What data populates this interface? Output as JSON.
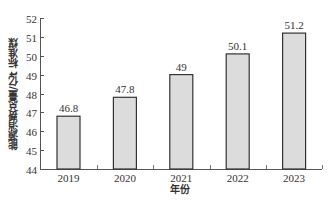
{
  "chart_data": {
    "type": "bar",
    "title": "",
    "categories": [
      "2019",
      "2020",
      "2021",
      "2022",
      "2023"
    ],
    "values": [
      46.8,
      47.8,
      49,
      50.1,
      51.2
    ],
    "value_labels": [
      "46.8",
      "47.8",
      "49",
      "50.1",
      "51.2"
    ],
    "xlabel": "年份",
    "ylabel": "能源消费总量/亿t 标准煤",
    "ylim": [
      44,
      52
    ],
    "yticks": [
      44,
      45,
      46,
      47,
      48,
      49,
      50,
      51,
      52
    ],
    "grid": false,
    "legend": null,
    "bar_fill": "#dcdcdc",
    "bar_edge": "#333333"
  }
}
